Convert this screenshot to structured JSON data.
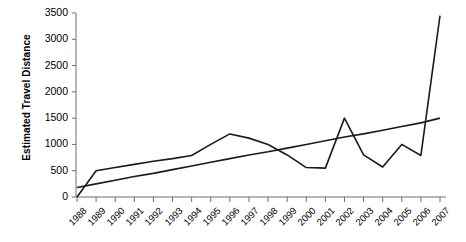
{
  "chart_data": {
    "type": "line",
    "title": "",
    "xlabel": "",
    "ylabel": "Estimated Travel Distance",
    "ylim": [
      0,
      3500
    ],
    "ytick_labels": [
      "0",
      "500",
      "1000",
      "1500",
      "2000",
      "2500",
      "3000",
      "3500"
    ],
    "ytick_values": [
      0,
      500,
      1000,
      1500,
      2000,
      2500,
      3000,
      3500
    ],
    "grid": false,
    "legend": "none",
    "categories": [
      "1988",
      "1989",
      "1990",
      "1991",
      "1992",
      "1993",
      "1994",
      "1995",
      "1996",
      "1997",
      "1998",
      "1999",
      "2000",
      "2001",
      "2002",
      "2003",
      "2004",
      "2005",
      "2006",
      "2007"
    ],
    "x": [
      1988,
      1989,
      1990,
      1991,
      1992,
      1993,
      1994,
      1995,
      1996,
      1997,
      1998,
      1999,
      2000,
      2001,
      2002,
      2003,
      2004,
      2005,
      2006,
      2007
    ],
    "series": [
      {
        "name": "Estimated Travel Distance",
        "values": [
          0,
          500,
          560,
          620,
          680,
          730,
          790,
          1000,
          1200,
          1120,
          1000,
          800,
          560,
          550,
          1500,
          800,
          570,
          1000,
          790,
          3450
        ]
      },
      {
        "name": "Linear trend",
        "values": [
          180,
          250,
          320,
          390,
          450,
          520,
          590,
          660,
          730,
          800,
          860,
          930,
          1000,
          1070,
          1140,
          1200,
          1270,
          1340,
          1410,
          1500
        ]
      }
    ]
  },
  "axis": {
    "y_title": "Estimated Travel Distance"
  }
}
